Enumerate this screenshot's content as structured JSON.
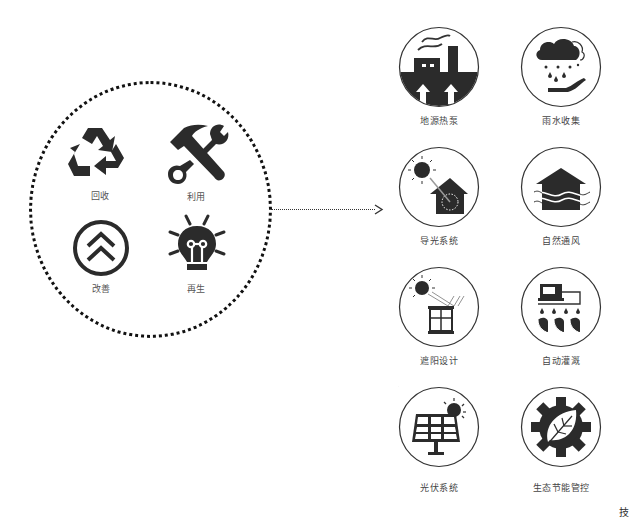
{
  "colors": {
    "ink": "#222222",
    "stroke": "#333333",
    "background": "#ffffff"
  },
  "left_group": {
    "items": [
      {
        "label": "回收",
        "icon": "recycle-icon"
      },
      {
        "label": "利用",
        "icon": "hammer-wrench-icon"
      },
      {
        "label": "改善",
        "icon": "double-chevron-up-icon"
      },
      {
        "label": "再生",
        "icon": "lightbulb-icon"
      }
    ]
  },
  "right_grid": {
    "items": [
      {
        "label": "地源热泵",
        "icon": "geothermal-factory-icon"
      },
      {
        "label": "雨水收集",
        "icon": "rain-collection-icon"
      },
      {
        "label": "导光系统",
        "icon": "light-guide-house-icon"
      },
      {
        "label": "自然通风",
        "icon": "natural-ventilation-house-icon"
      },
      {
        "label": "遮阳设计",
        "icon": "sunshade-window-icon"
      },
      {
        "label": "自动灌溉",
        "icon": "auto-irrigation-icon"
      },
      {
        "label": "光伏系统",
        "icon": "solar-panel-icon"
      },
      {
        "label": "生态节能管控",
        "icon": "eco-gear-leaf-icon"
      }
    ]
  },
  "corner_text": "技"
}
